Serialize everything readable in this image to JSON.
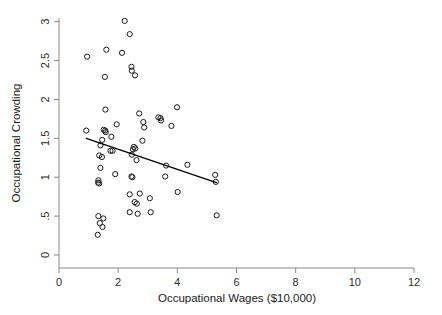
{
  "chart_data": {
    "type": "scatter",
    "title": "",
    "xlabel": "Occupational Wages ($10,000)",
    "ylabel": "Occupational Crowding",
    "xlim": [
      0,
      12
    ],
    "ylim": [
      0,
      3
    ],
    "xticks": [
      0,
      2,
      4,
      6,
      8,
      10,
      12
    ],
    "xticklabels": [
      "0",
      "2",
      "4",
      "6",
      "8",
      "10",
      "12"
    ],
    "yticks": [
      0,
      0.5,
      1,
      1.5,
      2,
      2.5,
      3
    ],
    "yticklabels": [
      "0",
      ".5",
      "1",
      "1.5",
      "2",
      "2.5",
      "3"
    ],
    "grid": false,
    "legend": null,
    "marker": "open-circle",
    "marker_color": "#1b1b1b",
    "points": [
      [
        2.22,
        3.01
      ],
      [
        2.39,
        2.84
      ],
      [
        1.6,
        2.64
      ],
      [
        2.13,
        2.6
      ],
      [
        0.95,
        2.55
      ],
      [
        2.45,
        2.42
      ],
      [
        2.46,
        2.37
      ],
      [
        2.57,
        2.31
      ],
      [
        1.55,
        2.29
      ],
      [
        1.57,
        1.87
      ],
      [
        3.99,
        1.9
      ],
      [
        2.71,
        1.82
      ],
      [
        3.36,
        1.77
      ],
      [
        3.43,
        1.76
      ],
      [
        3.45,
        1.73
      ],
      [
        1.95,
        1.68
      ],
      [
        3.8,
        1.66
      ],
      [
        2.85,
        1.71
      ],
      [
        2.88,
        1.64
      ],
      [
        0.92,
        1.6
      ],
      [
        1.51,
        1.61
      ],
      [
        1.56,
        1.6
      ],
      [
        1.58,
        1.58
      ],
      [
        1.77,
        1.52
      ],
      [
        2.82,
        1.47
      ],
      [
        1.46,
        1.48
      ],
      [
        1.4,
        1.41
      ],
      [
        2.53,
        1.39
      ],
      [
        2.58,
        1.37
      ],
      [
        2.5,
        1.36
      ],
      [
        1.74,
        1.34
      ],
      [
        1.81,
        1.34
      ],
      [
        1.36,
        1.28
      ],
      [
        1.45,
        1.26
      ],
      [
        2.46,
        1.29
      ],
      [
        2.62,
        1.22
      ],
      [
        3.62,
        1.15
      ],
      [
        4.34,
        1.16
      ],
      [
        1.4,
        1.12
      ],
      [
        1.9,
        1.04
      ],
      [
        3.59,
        1.01
      ],
      [
        2.45,
        1.01
      ],
      [
        2.48,
        1.0
      ],
      [
        5.28,
        1.03
      ],
      [
        1.33,
        0.96
      ],
      [
        1.32,
        0.93
      ],
      [
        1.36,
        0.92
      ],
      [
        5.3,
        0.94
      ],
      [
        4.01,
        0.81
      ],
      [
        2.39,
        0.78
      ],
      [
        2.73,
        0.79
      ],
      [
        3.07,
        0.73
      ],
      [
        2.56,
        0.68
      ],
      [
        2.63,
        0.66
      ],
      [
        1.33,
        0.5
      ],
      [
        1.5,
        0.47
      ],
      [
        3.1,
        0.55
      ],
      [
        2.39,
        0.55
      ],
      [
        2.66,
        0.53
      ],
      [
        5.33,
        0.51
      ],
      [
        1.38,
        0.41
      ],
      [
        1.47,
        0.36
      ],
      [
        1.31,
        0.26
      ]
    ],
    "fit_line": {
      "type": "linear-fit",
      "x_start": 0.92,
      "y_start": 1.5,
      "x_end": 5.32,
      "y_end": 0.93
    }
  }
}
